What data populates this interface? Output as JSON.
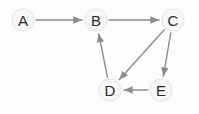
{
  "diagram": {
    "background_color": "#fdfdfd",
    "node_fill_color": "#f7f7f7",
    "node_stroke_color": "#e3e3e3",
    "node_label_color": "#2b2b2b",
    "edge_color": "#8c8c8c",
    "node_radius": 11,
    "nodes": [
      {
        "id": "A",
        "label": "A",
        "x": 23,
        "y": 20
      },
      {
        "id": "B",
        "label": "B",
        "x": 96,
        "y": 20
      },
      {
        "id": "C",
        "label": "C",
        "x": 173,
        "y": 20
      },
      {
        "id": "D",
        "label": "D",
        "x": 110,
        "y": 90
      },
      {
        "id": "E",
        "label": "E",
        "x": 161,
        "y": 90
      }
    ],
    "edges": [
      {
        "from": "A",
        "to": "B",
        "directed": true
      },
      {
        "from": "B",
        "to": "C",
        "directed": true
      },
      {
        "from": "C",
        "to": "D",
        "directed": true
      },
      {
        "from": "C",
        "to": "E",
        "directed": true
      },
      {
        "from": "E",
        "to": "D",
        "directed": true
      },
      {
        "from": "D",
        "to": "B",
        "directed": true
      }
    ]
  }
}
